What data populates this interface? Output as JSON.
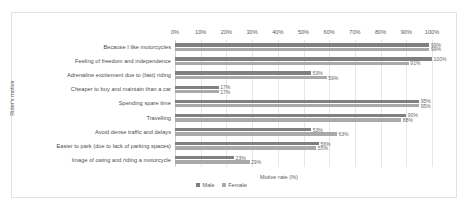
{
  "chart_data": {
    "type": "bar",
    "orientation": "horizontal",
    "title": "",
    "xlabel": "Motive rate (%)",
    "ylabel": "Rider's motive",
    "xlim": [
      0,
      100
    ],
    "xticks": [
      "0%",
      "10%",
      "20%",
      "30%",
      "40%",
      "50%",
      "60%",
      "70%",
      "80%",
      "90%",
      "100%"
    ],
    "xtick_values": [
      0,
      10,
      20,
      30,
      40,
      50,
      60,
      70,
      80,
      90,
      100
    ],
    "grid": true,
    "legend_position": "bottom",
    "categories": [
      "Because I like motorcycles",
      "Feeling of freedom and independence",
      "Adrenaline excitement due to (fast) riding",
      "Cheaper to buy and maintain than a car",
      "Spending spare time",
      "Travelling",
      "Avoid dense traffic and delays",
      "Easier to park (due to lack of parking spaces)",
      "Image of owing and riding a motorcycle"
    ],
    "series": [
      {
        "name": "Male",
        "color": "#808080",
        "values": [
          99,
          100,
          53,
          17,
          95,
          90,
          53,
          56,
          23
        ],
        "labels": [
          "99%",
          "100%",
          "53%",
          "17%",
          "95%",
          "90%",
          "53%",
          "56%",
          "23%"
        ]
      },
      {
        "name": "Female",
        "color": "#a9a9a9",
        "values": [
          99,
          91,
          59,
          17,
          95,
          88,
          63,
          55,
          29
        ],
        "labels": [
          "99%",
          "91%",
          "59%",
          "17%",
          "95%",
          "88%",
          "63%",
          "55%",
          "29%"
        ]
      }
    ]
  }
}
